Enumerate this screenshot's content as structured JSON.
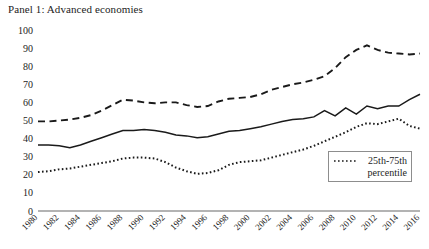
{
  "chart_data": {
    "type": "line",
    "title": "Panel 1: Advanced economies",
    "xlabel": "",
    "ylabel": "",
    "ylim": [
      0,
      100
    ],
    "ytick_step": 10,
    "yticks": [
      0,
      10,
      20,
      30,
      40,
      50,
      60,
      70,
      80,
      90,
      100
    ],
    "grid": false,
    "legend_position": "bottom-right",
    "x": [
      1980,
      1981,
      1982,
      1983,
      1984,
      1985,
      1986,
      1987,
      1988,
      1989,
      1990,
      1991,
      1992,
      1993,
      1994,
      1995,
      1996,
      1997,
      1998,
      1999,
      2000,
      2001,
      2002,
      2003,
      2004,
      2005,
      2006,
      2007,
      2008,
      2009,
      2010,
      2011,
      2012,
      2013,
      2014,
      2015,
      2016
    ],
    "xtick_labels": [
      "1980",
      "1982",
      "1984",
      "1986",
      "1988",
      "1990",
      "1992",
      "1994",
      "1996",
      "1998",
      "2000",
      "2002",
      "2004",
      "2006",
      "2008",
      "2010",
      "2012",
      "2014",
      "2016"
    ],
    "series": [
      {
        "name": "75th percentile",
        "style": "dashed",
        "values": [
          49.5,
          49.5,
          50.0,
          50.5,
          51.5,
          53.0,
          55.5,
          58.5,
          61.5,
          61.0,
          60.0,
          59.5,
          60.0,
          60.0,
          58.5,
          57.5,
          58.0,
          60.5,
          62.0,
          62.5,
          63.0,
          64.5,
          67.0,
          68.5,
          70.0,
          71.0,
          72.5,
          74.5,
          79.0,
          85.0,
          89.0,
          91.5,
          89.0,
          87.5,
          87.0,
          86.5,
          87.0
        ]
      },
      {
        "name": "Median",
        "style": "solid",
        "values": [
          36.5,
          36.5,
          36.0,
          35.0,
          36.5,
          38.5,
          40.5,
          42.5,
          44.5,
          44.5,
          45.0,
          44.5,
          43.5,
          42.0,
          41.5,
          40.5,
          41.0,
          42.5,
          44.0,
          44.5,
          45.5,
          46.5,
          48.0,
          49.5,
          50.5,
          51.0,
          52.0,
          55.5,
          52.5,
          57.0,
          53.5,
          58.0,
          56.5,
          58.0,
          58.0,
          61.5,
          64.5
        ]
      },
      {
        "name": "25th percentile",
        "style": "dotted",
        "values": [
          21.5,
          22.0,
          23.0,
          23.5,
          24.5,
          25.5,
          26.5,
          27.5,
          29.0,
          29.5,
          29.5,
          29.0,
          27.0,
          24.0,
          22.0,
          20.5,
          21.0,
          22.5,
          25.5,
          27.0,
          27.5,
          28.0,
          29.5,
          31.0,
          32.5,
          34.0,
          36.0,
          38.5,
          41.0,
          43.5,
          46.5,
          48.5,
          48.0,
          49.5,
          51.0,
          47.0,
          45.5
        ]
      }
    ],
    "legend": {
      "swatch_style": "dotted",
      "label_line1": "25th-75th",
      "label_line2": "percentile"
    }
  }
}
